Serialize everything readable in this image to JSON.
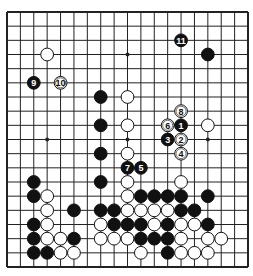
{
  "diagram": {
    "type": "go-board",
    "board_size": 19,
    "colors": {
      "background": "#ffffff",
      "line": "#222222",
      "black": "#111111",
      "white": "#ffffff"
    },
    "star_points": [
      [
        3,
        3
      ],
      [
        3,
        9
      ],
      [
        3,
        15
      ],
      [
        9,
        3
      ],
      [
        9,
        9
      ],
      [
        9,
        15
      ],
      [
        15,
        3
      ],
      [
        15,
        9
      ],
      [
        15,
        15
      ]
    ],
    "stones": [
      {
        "color": "white",
        "col": 3,
        "row": 3
      },
      {
        "color": "black",
        "col": 2,
        "row": 5,
        "label": "9"
      },
      {
        "color": "white",
        "col": 4,
        "row": 5,
        "label": "10"
      },
      {
        "color": "black",
        "col": 13,
        "row": 2,
        "label": "11"
      },
      {
        "color": "black",
        "col": 15,
        "row": 3
      },
      {
        "color": "black",
        "col": 7,
        "row": 6
      },
      {
        "color": "white",
        "col": 9,
        "row": 6
      },
      {
        "color": "white",
        "col": 13,
        "row": 7,
        "label": "8"
      },
      {
        "color": "black",
        "col": 7,
        "row": 8
      },
      {
        "color": "white",
        "col": 9,
        "row": 8
      },
      {
        "color": "white",
        "col": 12,
        "row": 8,
        "label": "6"
      },
      {
        "color": "black",
        "col": 13,
        "row": 8,
        "label": "1"
      },
      {
        "color": "white",
        "col": 15,
        "row": 8
      },
      {
        "color": "black",
        "col": 12,
        "row": 9,
        "label": "3"
      },
      {
        "color": "white",
        "col": 13,
        "row": 9,
        "label": "2"
      },
      {
        "color": "black",
        "col": 7,
        "row": 10
      },
      {
        "color": "white",
        "col": 9,
        "row": 10
      },
      {
        "color": "white",
        "col": 13,
        "row": 10,
        "label": "4"
      },
      {
        "color": "black",
        "col": 9,
        "row": 11,
        "label": "7"
      },
      {
        "color": "black",
        "col": 10,
        "row": 11,
        "label": "5"
      },
      {
        "color": "black",
        "col": 2,
        "row": 12
      },
      {
        "color": "black",
        "col": 7,
        "row": 12
      },
      {
        "color": "white",
        "col": 9,
        "row": 12
      },
      {
        "color": "white",
        "col": 13,
        "row": 12
      },
      {
        "color": "black",
        "col": 2,
        "row": 13
      },
      {
        "color": "white",
        "col": 3,
        "row": 13
      },
      {
        "color": "white",
        "col": 9,
        "row": 13
      },
      {
        "color": "black",
        "col": 10,
        "row": 13
      },
      {
        "color": "black",
        "col": 11,
        "row": 13
      },
      {
        "color": "black",
        "col": 12,
        "row": 13
      },
      {
        "color": "black",
        "col": 13,
        "row": 13
      },
      {
        "color": "black",
        "col": 15,
        "row": 13
      },
      {
        "color": "white",
        "col": 3,
        "row": 14
      },
      {
        "color": "black",
        "col": 5,
        "row": 14
      },
      {
        "color": "black",
        "col": 7,
        "row": 14
      },
      {
        "color": "black",
        "col": 8,
        "row": 14
      },
      {
        "color": "white",
        "col": 9,
        "row": 14
      },
      {
        "color": "white",
        "col": 10,
        "row": 14
      },
      {
        "color": "white",
        "col": 11,
        "row": 14
      },
      {
        "color": "white",
        "col": 12,
        "row": 14
      },
      {
        "color": "black",
        "col": 13,
        "row": 14
      },
      {
        "color": "black",
        "col": 14,
        "row": 14
      },
      {
        "color": "black",
        "col": 2,
        "row": 15
      },
      {
        "color": "white",
        "col": 3,
        "row": 15
      },
      {
        "color": "white",
        "col": 7,
        "row": 15
      },
      {
        "color": "black",
        "col": 8,
        "row": 15
      },
      {
        "color": "black",
        "col": 9,
        "row": 15
      },
      {
        "color": "black",
        "col": 10,
        "row": 15
      },
      {
        "color": "white",
        "col": 11,
        "row": 15
      },
      {
        "color": "black",
        "col": 12,
        "row": 15
      },
      {
        "color": "white",
        "col": 13,
        "row": 15
      },
      {
        "color": "white",
        "col": 14,
        "row": 15
      },
      {
        "color": "black",
        "col": 15,
        "row": 15
      },
      {
        "color": "black",
        "col": 2,
        "row": 16
      },
      {
        "color": "white",
        "col": 3,
        "row": 16
      },
      {
        "color": "white",
        "col": 4,
        "row": 16
      },
      {
        "color": "black",
        "col": 5,
        "row": 16
      },
      {
        "color": "white",
        "col": 7,
        "row": 16
      },
      {
        "color": "white",
        "col": 8,
        "row": 16
      },
      {
        "color": "white",
        "col": 9,
        "row": 16
      },
      {
        "color": "black",
        "col": 10,
        "row": 16
      },
      {
        "color": "black",
        "col": 11,
        "row": 16
      },
      {
        "color": "black",
        "col": 12,
        "row": 16
      },
      {
        "color": "white",
        "col": 13,
        "row": 16
      },
      {
        "color": "white",
        "col": 15,
        "row": 16
      },
      {
        "color": "white",
        "col": 16,
        "row": 16
      },
      {
        "color": "black",
        "col": 2,
        "row": 17
      },
      {
        "color": "black",
        "col": 3,
        "row": 17
      },
      {
        "color": "white",
        "col": 4,
        "row": 17
      },
      {
        "color": "white",
        "col": 5,
        "row": 17
      },
      {
        "color": "white",
        "col": 10,
        "row": 17
      },
      {
        "color": "black",
        "col": 12,
        "row": 17
      },
      {
        "color": "white",
        "col": 13,
        "row": 17
      },
      {
        "color": "white",
        "col": 14,
        "row": 17
      },
      {
        "color": "white",
        "col": 15,
        "row": 17
      }
    ]
  }
}
